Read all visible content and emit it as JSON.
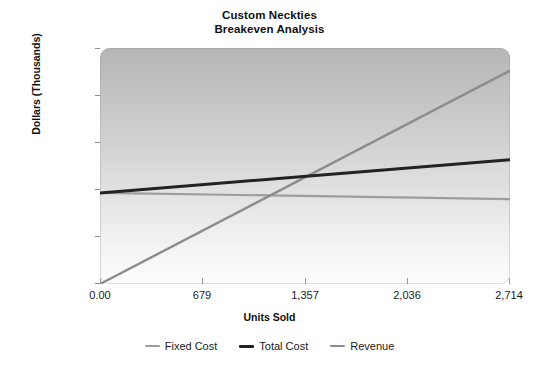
{
  "chart_data": {
    "type": "line",
    "title": "Custom Neckties Breakeven Analysis",
    "title_lines": [
      "Custom Neckties",
      "Breakeven Analysis"
    ],
    "xlabel": "Units Sold",
    "ylabel": "Dollars (Thousands)",
    "xlim": [
      0,
      2714
    ],
    "ylim": [
      0,
      50
    ],
    "grid": false,
    "legend_position": "bottom",
    "x_ticks": [
      0,
      679,
      1357,
      2036,
      2714
    ],
    "x_tick_labels": [
      "0.00",
      "679",
      "1,357",
      "2,036",
      "2,714"
    ],
    "y_ticks": [
      0,
      10,
      20,
      30,
      40,
      50
    ],
    "y_tick_labels": [
      "0",
      "10",
      "20",
      "30",
      "40",
      "50"
    ],
    "x": [
      0,
      2714
    ],
    "series": [
      {
        "name": "Fixed Cost",
        "values": [
          19.3,
          18.0
        ],
        "color": "#9d9d9d",
        "width": 2.2
      },
      {
        "name": "Total Cost",
        "values": [
          19.3,
          26.3
        ],
        "color": "#222222",
        "width": 3.0
      },
      {
        "name": "Revenue",
        "values": [
          0.0,
          45.2
        ],
        "color": "#8c8c8c",
        "width": 2.4
      }
    ],
    "breakeven": {
      "units": 1080,
      "dollars": 20.8
    }
  },
  "legend": {
    "items": [
      {
        "label": "Fixed Cost",
        "color": "#9d9d9d",
        "thickness": "2px"
      },
      {
        "label": "Total Cost",
        "color": "#222222",
        "thickness": "3px"
      },
      {
        "label": "Revenue",
        "color": "#8c8c8c",
        "thickness": "2px"
      }
    ]
  },
  "colors": {
    "plot_background_top": "#b5b5b5",
    "plot_background_bottom": "#fcfcfc",
    "page_background": "#ffffff",
    "text": "#1a1a1a",
    "axis": "#9a9a9a"
  }
}
